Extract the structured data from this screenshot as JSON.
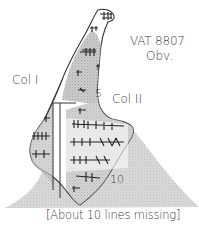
{
  "figure": {
    "tablet_id": "VAT 8807",
    "side": "Obv.",
    "columns": [
      {
        "label": "Col I"
      },
      {
        "label": "Col II"
      }
    ],
    "line_markers": [
      "5",
      "10"
    ],
    "note": "[About 10 lines missing]"
  },
  "colors": {
    "ink": "#3a3a3a",
    "stipple": "#c9c9c9",
    "background": "#ffffff"
  }
}
